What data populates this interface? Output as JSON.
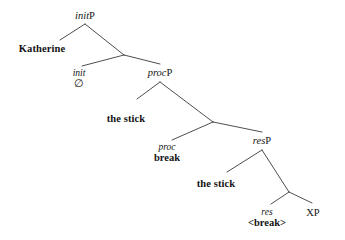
{
  "figure": {
    "kind": "syntax-tree",
    "theme": {
      "background": "#ffffff",
      "line_color": "#3a3a3a",
      "text_color": "#141414"
    },
    "nodes": [
      {
        "id": "initP",
        "role": "phrase-label",
        "category": "init",
        "projection": "P",
        "text": "initP",
        "x": 85,
        "y": 11
      },
      {
        "id": "katherine",
        "role": "lexical-specifier",
        "text": "Katherine",
        "x": 42,
        "y": 44
      },
      {
        "id": "init-head",
        "role": "head",
        "head_text": "init",
        "spellout_text": "∅",
        "spellout_kind": "null",
        "x": 79,
        "y": 69
      },
      {
        "id": "procP",
        "role": "phrase-label",
        "category": "proc",
        "projection": "P",
        "text": "procP",
        "x": 160,
        "y": 68
      },
      {
        "id": "the-stick-proc",
        "role": "lexical-specifier",
        "text": "the stick",
        "x": 126,
        "y": 114
      },
      {
        "id": "proc-head",
        "role": "head",
        "head_text": "proc",
        "spellout_text": "break",
        "spellout_kind": "bold",
        "x": 167,
        "y": 143
      },
      {
        "id": "resP",
        "role": "phrase-label",
        "category": "res",
        "projection": "P",
        "text": "resP",
        "x": 262,
        "y": 136
      },
      {
        "id": "the-stick-res",
        "role": "lexical-specifier",
        "text": "the stick",
        "x": 216,
        "y": 179
      },
      {
        "id": "res-head",
        "role": "head",
        "head_text": "res",
        "spellout_text": "<break>",
        "spellout_kind": "bold",
        "x": 267,
        "y": 208
      },
      {
        "id": "xp",
        "role": "phrase-label-plain",
        "text": "XP",
        "x": 313,
        "y": 208
      }
    ],
    "edges": [
      {
        "id": "initP-to-katherine",
        "from": "initP",
        "to": "katherine",
        "x1": 85,
        "y1": 24,
        "x2": 60,
        "y2": 40
      },
      {
        "id": "initP-to-initbar",
        "from": "initP",
        "to": "init-bar",
        "x1": 85,
        "y1": 24,
        "x2": 124,
        "y2": 55
      },
      {
        "id": "initbar-to-init",
        "from": "init-bar",
        "to": "init-head",
        "x1": 124,
        "y1": 55,
        "x2": 82,
        "y2": 66
      },
      {
        "id": "initbar-to-procP",
        "from": "init-bar",
        "to": "procP",
        "x1": 124,
        "y1": 55,
        "x2": 160,
        "y2": 64
      },
      {
        "id": "procP-to-thestick",
        "from": "procP",
        "to": "the-stick-proc",
        "x1": 160,
        "y1": 82,
        "x2": 137,
        "y2": 99
      },
      {
        "id": "procP-to-procbar",
        "from": "procP",
        "to": "proc-bar",
        "x1": 160,
        "y1": 82,
        "x2": 213,
        "y2": 122
      },
      {
        "id": "procbar-to-proc",
        "from": "proc-bar",
        "to": "proc-head",
        "x1": 213,
        "y1": 122,
        "x2": 172,
        "y2": 140
      },
      {
        "id": "procbar-to-resP",
        "from": "proc-bar",
        "to": "resP",
        "x1": 213,
        "y1": 122,
        "x2": 262,
        "y2": 132
      },
      {
        "id": "resP-to-thestick",
        "from": "resP",
        "to": "the-stick-res",
        "x1": 262,
        "y1": 150,
        "x2": 227,
        "y2": 172
      },
      {
        "id": "resP-to-resbar",
        "from": "resP",
        "to": "res-bar",
        "x1": 262,
        "y1": 150,
        "x2": 289,
        "y2": 192
      },
      {
        "id": "resbar-to-res",
        "from": "res-bar",
        "to": "res-head",
        "x1": 289,
        "y1": 192,
        "x2": 271,
        "y2": 204
      },
      {
        "id": "resbar-to-xp",
        "from": "res-bar",
        "to": "xp",
        "x1": 289,
        "y1": 192,
        "x2": 312,
        "y2": 203
      }
    ]
  }
}
